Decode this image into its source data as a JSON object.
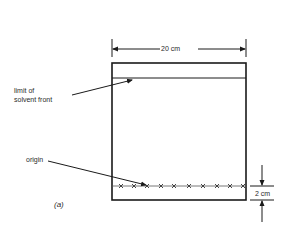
{
  "diagram": {
    "width_label": "20 cm",
    "solvent_front_label_line1": "limit of",
    "solvent_front_label_line2": "solvent front",
    "origin_label": "origin",
    "origin_height_label": "2 cm",
    "panel_label": "(a)",
    "spot_marker": "×",
    "spot_count": 10,
    "line_color": "#1a1a1a"
  }
}
